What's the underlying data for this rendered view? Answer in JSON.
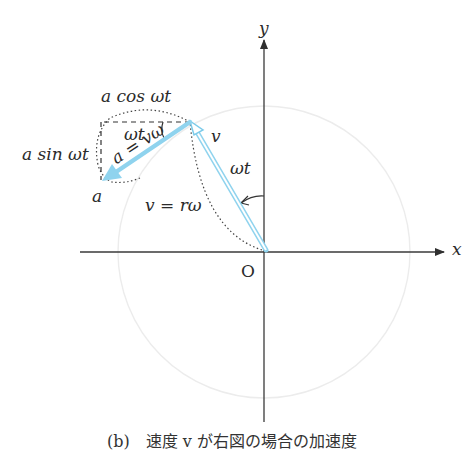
{
  "diagram": {
    "axes": {
      "x_label": "x",
      "y_label": "y",
      "origin_label": "O"
    },
    "labels": {
      "a_cos": "a cos ωt",
      "a_sin": "a sin ωt",
      "angle_top": "ωt",
      "v_tip": "v",
      "angle_right": "ωt",
      "a_eq": "a = vω",
      "a_tip": "a",
      "v_eq": "v = rω"
    },
    "caption": "(b)　速度 v が右図の場合の加速度",
    "colors": {
      "axis": "#3a3a3a",
      "vector": "#8fd3ee",
      "vector_outline": "#6cc4e6",
      "circle": "#ececec",
      "dotted": "#444444",
      "text": "#2b2b2b"
    }
  }
}
